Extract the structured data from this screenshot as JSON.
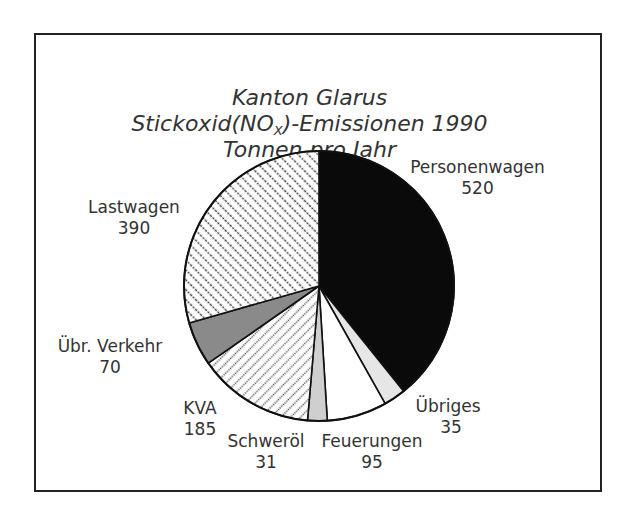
{
  "chart_data": {
    "type": "pie",
    "title": "Kanton Glarus",
    "subtitle_prefix": "Stickoxid(NO",
    "subtitle_sub": "X",
    "subtitle_suffix": ")-Emissionen 1990",
    "unit_line": "Tonnen pro Jahr",
    "start_angle_deg": 0,
    "direction": "clockwise",
    "slices": [
      {
        "label": "Personenwagen",
        "value": 520,
        "fill": "solid-black"
      },
      {
        "label": "Übriges",
        "value": 35,
        "fill": "light-gray"
      },
      {
        "label": "Feuerungen",
        "value": 95,
        "fill": "white"
      },
      {
        "label": "Schweröl",
        "value": 31,
        "fill": "light-gray"
      },
      {
        "label": "KVA",
        "value": 185,
        "fill": "dotted-diagonal"
      },
      {
        "label": "Übr. Verkehr",
        "value": 70,
        "fill": "medium-gray"
      },
      {
        "label": "Lastwagen",
        "value": 390,
        "fill": "dashed-diagonal"
      }
    ],
    "total": 1326
  },
  "labels": {
    "personenwagen": {
      "name": "Personenwagen",
      "value": "520"
    },
    "lastwagen": {
      "name": "Lastwagen",
      "value": "390"
    },
    "uebr_verkehr": {
      "name": "Übr. Verkehr",
      "value": "70"
    },
    "kva": {
      "name": "KVA",
      "value": "185"
    },
    "schweroel": {
      "name": "Schweröl",
      "value": "31"
    },
    "feuerungen": {
      "name": "Feuerungen",
      "value": "95"
    },
    "uebriges": {
      "name": "Übriges",
      "value": "35"
    }
  },
  "colors": {
    "personenwagen": "#0a0a0a",
    "uebriges": "#e6e6e6",
    "feuerungen": "#ffffff",
    "schweroel": "#cfcfcf",
    "uebr_verkehr": "#8a8a8a",
    "outline": "#111111"
  }
}
